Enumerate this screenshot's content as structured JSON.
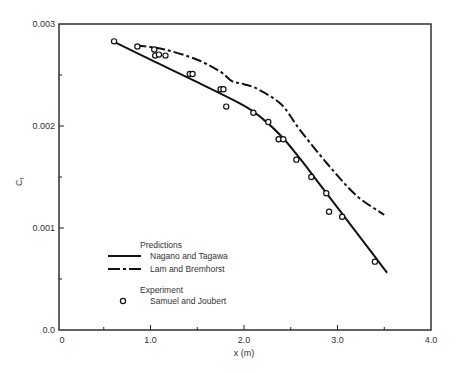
{
  "chart_data": {
    "type": "line",
    "title": "",
    "xlabel": "x (m)",
    "ylabel": "Cf",
    "xlim": [
      0,
      4.0
    ],
    "ylim": [
      0,
      0.003
    ],
    "grid": false,
    "legend_position": "lower-left inside",
    "x_ticks": [
      "0",
      "1.0",
      "2.0",
      "3.0",
      "4.0"
    ],
    "y_ticks": [
      "0.0",
      "0.001",
      "0.002",
      "0.003"
    ],
    "legend": {
      "predictions_header": "Predictions",
      "experiment_header": "Experiment",
      "entries": [
        "Nagano and Tagawa",
        "Lam and Bremhorst",
        "Samuel and Joubert"
      ]
    },
    "series": [
      {
        "name": "Nagano and Tagawa",
        "style": "solid",
        "x": [
          0.6,
          1.0,
          1.5,
          2.0,
          2.2,
          2.4,
          2.6,
          2.8,
          3.0,
          3.2,
          3.4,
          3.53
        ],
        "y": [
          0.00283,
          0.00265,
          0.00243,
          0.0022,
          0.00207,
          0.0019,
          0.00168,
          0.00144,
          0.0012,
          0.00096,
          0.00072,
          0.00056
        ]
      },
      {
        "name": "Lam and Bremhorst",
        "style": "dash-dot",
        "x": [
          0.85,
          1.15,
          1.5,
          1.75,
          1.87,
          2.0,
          2.15,
          2.4,
          2.6,
          2.9,
          3.2,
          3.5
        ],
        "y": [
          0.00279,
          0.00275,
          0.00265,
          0.00253,
          0.00244,
          0.00241,
          0.00236,
          0.00221,
          0.00196,
          0.00162,
          0.00132,
          0.00113
        ]
      },
      {
        "name": "Samuel and Joubert",
        "style": "open-circle markers",
        "x": [
          0.61,
          0.86,
          1.04,
          1.05,
          1.09,
          1.16,
          1.42,
          1.45,
          1.75,
          1.78,
          1.81,
          2.1,
          2.26,
          2.37,
          2.42,
          2.56,
          2.72,
          2.88,
          2.91,
          3.05,
          3.4
        ],
        "y": [
          0.00283,
          0.00278,
          0.00275,
          0.00269,
          0.0027,
          0.00269,
          0.00251,
          0.00251,
          0.00236,
          0.00236,
          0.00219,
          0.00213,
          0.00204,
          0.00187,
          0.00187,
          0.00167,
          0.0015,
          0.00134,
          0.00116,
          0.00111,
          0.00067
        ]
      }
    ]
  }
}
